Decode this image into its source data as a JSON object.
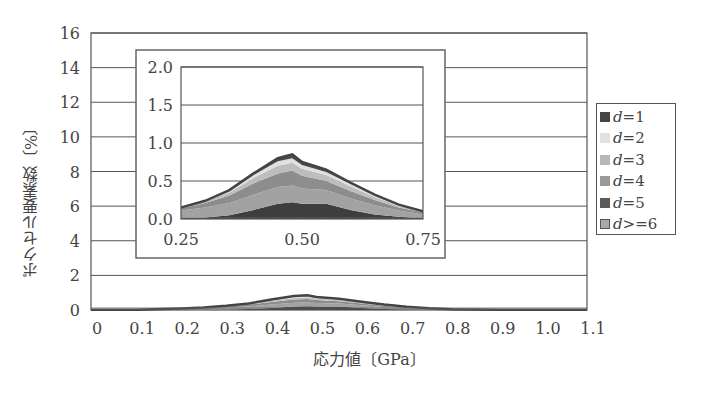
{
  "chart_data": [
    {
      "type": "area",
      "stacked": true,
      "title": "",
      "xlabel": "応力値〔GPa〕",
      "ylabel": "ボクセル要素数〔%〕",
      "xlim": [
        0,
        1.1
      ],
      "ylim": [
        0,
        16
      ],
      "xticks": [
        "0",
        "0.1",
        "0.2",
        "0.3",
        "0.4",
        "0.5",
        "0.6",
        "0.7",
        "0.8",
        "0.9",
        "1.0",
        "1.1"
      ],
      "yticks": [
        "0",
        "2",
        "4",
        "6",
        "8",
        "10",
        "12",
        "14",
        "16"
      ],
      "grid": "horizontal",
      "legend_position": "right",
      "x": [
        0.0,
        0.1,
        0.2,
        0.25,
        0.3,
        0.35,
        0.4,
        0.45,
        0.48,
        0.5,
        0.55,
        0.6,
        0.65,
        0.7,
        0.75,
        0.8,
        0.9,
        1.0,
        1.1
      ],
      "series": [
        {
          "name": "d=1",
          "values": [
            0.02,
            0.02,
            0.02,
            0.01,
            0.02,
            0.05,
            0.12,
            0.2,
            0.22,
            0.2,
            0.2,
            0.12,
            0.06,
            0.03,
            0.01,
            0.01,
            0.01,
            0.01,
            0.01
          ]
        },
        {
          "name": "d=2",
          "values": [
            0.0,
            0.0,
            0.04,
            0.1,
            0.13,
            0.16,
            0.2,
            0.22,
            0.22,
            0.2,
            0.18,
            0.15,
            0.12,
            0.08,
            0.05,
            0.02,
            0.0,
            0.0,
            0.0
          ]
        },
        {
          "name": "d=3",
          "values": [
            0.0,
            0.0,
            0.02,
            0.03,
            0.06,
            0.1,
            0.15,
            0.18,
            0.2,
            0.17,
            0.12,
            0.1,
            0.07,
            0.04,
            0.03,
            0.01,
            0.0,
            0.0,
            0.0
          ]
        },
        {
          "name": "d=4",
          "values": [
            0.0,
            0.0,
            0.01,
            0.01,
            0.02,
            0.04,
            0.07,
            0.1,
            0.1,
            0.09,
            0.08,
            0.06,
            0.04,
            0.02,
            0.01,
            0.0,
            0.0,
            0.0,
            0.0
          ]
        },
        {
          "name": "d=5",
          "values": [
            0.0,
            0.0,
            0.0,
            0.0,
            0.01,
            0.02,
            0.04,
            0.06,
            0.06,
            0.05,
            0.04,
            0.03,
            0.02,
            0.01,
            0.0,
            0.0,
            0.0,
            0.0,
            0.0
          ]
        },
        {
          "name": "d>=6",
          "values": [
            0.0,
            0.0,
            0.0,
            0.0,
            0.0,
            0.01,
            0.02,
            0.04,
            0.05,
            0.04,
            0.03,
            0.02,
            0.01,
            0.01,
            0.0,
            0.0,
            0.0,
            0.0,
            0.0
          ]
        }
      ],
      "totals_approx": [
        0.02,
        0.02,
        0.09,
        0.15,
        0.24,
        0.38,
        0.6,
        0.8,
        0.85,
        0.75,
        0.65,
        0.48,
        0.32,
        0.19,
        0.1,
        0.04,
        0.01,
        0.01,
        0.01
      ],
      "inset": {
        "xlim": [
          0.25,
          0.75
        ],
        "ylim": [
          0.0,
          2.0
        ],
        "xticks": [
          "0.25",
          "0.50",
          "0.75"
        ],
        "yticks": [
          "0.0",
          "0.5",
          "1.0",
          "1.5",
          "2.0"
        ],
        "description": "zoomed view of the stacked distribution between 0.25 and 0.75 GPa; peak ≈0.83% near 0.47 GPa"
      }
    }
  ],
  "legend": {
    "items": [
      {
        "var": "d",
        "rel": "=1",
        "color": "#444444"
      },
      {
        "var": "d",
        "rel": "=2",
        "color": "#e2e2e2"
      },
      {
        "var": "d",
        "rel": "=3",
        "color": "#b8b8b8"
      },
      {
        "var": "d",
        "rel": "=4",
        "color": "#9a9a9a"
      },
      {
        "var": "d",
        "rel": "=5",
        "color": "#5a5a5a"
      },
      {
        "var": "d",
        "rel": ">=6",
        "color": "#a8a8a8"
      }
    ]
  },
  "axes": {
    "xlabel": "応力値〔GPa〕",
    "ylabel": "ボクセル要素数〔%〕",
    "main_yticks": [
      "0",
      "2",
      "4",
      "6",
      "8",
      "10",
      "12",
      "14",
      "16"
    ],
    "main_xticks": [
      "0",
      "0.1",
      "0.2",
      "0.3",
      "0.4",
      "0.5",
      "0.6",
      "0.7",
      "0.8",
      "0.9",
      "1.0",
      "1.1"
    ],
    "inset_yticks": [
      "0.0",
      "0.5",
      "1.0",
      "1.5",
      "2.0"
    ],
    "inset_xticks": [
      "0.25",
      "0.50",
      "0.75"
    ]
  }
}
